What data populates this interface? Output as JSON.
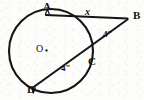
{
  "figure": {
    "kind": "circle-tangent-secant-geometry-diagram",
    "background_color": "#fdfdfb",
    "stroke_color": "#111111",
    "circle": {
      "center_label": "O",
      "center_x": 51,
      "center_y": 51,
      "radius": 42
    },
    "points": [
      {
        "id": "A",
        "label": "A",
        "x": 47,
        "y": 14,
        "on_circle": true
      },
      {
        "id": "B",
        "label": "B",
        "x": 127,
        "y": 18,
        "on_circle": false
      },
      {
        "id": "C",
        "label": "C",
        "x": 88,
        "y": 56,
        "on_circle": true
      },
      {
        "id": "D",
        "label": "D",
        "x": 33,
        "y": 88,
        "on_circle": true
      },
      {
        "id": "O",
        "label": "O",
        "x": 51,
        "y": 51,
        "on_circle": false
      }
    ],
    "segments": [
      {
        "id": "AB",
        "from": "A",
        "to": "B",
        "label": "x",
        "role": "tangent"
      },
      {
        "id": "BC",
        "from": "B",
        "to": "C",
        "label": "4\"",
        "role": "secant-external"
      },
      {
        "id": "CD",
        "from": "C",
        "to": "D",
        "label": "4\"",
        "role": "secant-chord"
      },
      {
        "id": "AD",
        "from": "A",
        "to": "D",
        "label": "",
        "role": "arc-chord-none"
      }
    ],
    "labels": {
      "point_a": "A",
      "point_b": "B",
      "point_c": "C",
      "point_d": "D",
      "center": "O",
      "tangent_length": "x",
      "secant_external": "4\"",
      "secant_chord": "4\""
    }
  }
}
